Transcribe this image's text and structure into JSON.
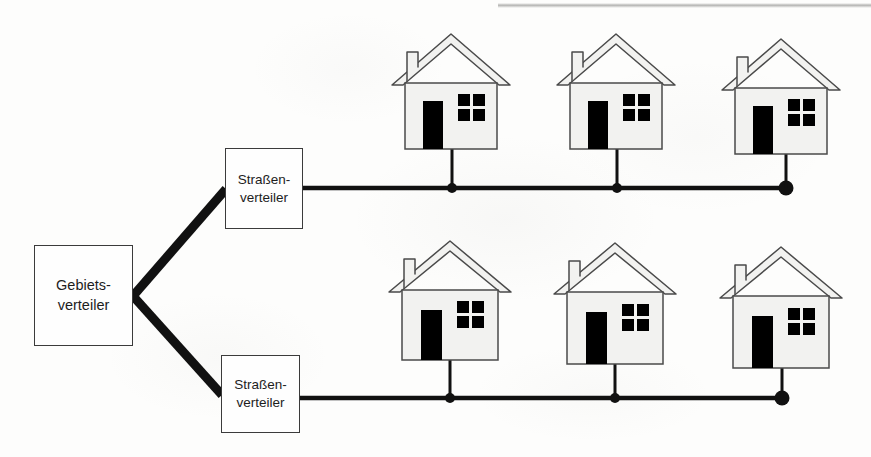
{
  "diagram": {
    "type": "network-topology-tree",
    "language": "de",
    "background_color": "#fdfdfc",
    "line_color": "#111111",
    "box_border_color": "#3b3b3b",
    "house_fill_color": "#f2f2f0",
    "house_outline_color": "#4a4a4a",
    "house_detail_color": "#000000"
  },
  "nodes": {
    "gebietsverteiler": {
      "label_line1": "Gebiets-",
      "label_line2": "verteiler",
      "x": 34,
      "y": 245,
      "width": 99,
      "height": 101
    },
    "strassenverteiler_oben": {
      "label_line1": "Straßen-",
      "label_line2": "verteiler",
      "x": 225,
      "y": 148,
      "width": 78,
      "height": 81
    },
    "strassenverteiler_unten": {
      "label_line1": "Straßen-",
      "label_line2": "verteiler",
      "x": 221,
      "y": 355,
      "width": 79,
      "height": 78
    }
  },
  "trunk_lines": [
    {
      "name": "gebietsverteiler-to-strassenverteiler-oben",
      "from_x": 133,
      "from_y": 296,
      "to_x": 226,
      "to_y": 189,
      "stroke_width": 9
    },
    {
      "name": "gebietsverteiler-to-strassenverteiler-unten",
      "from_x": 133,
      "from_y": 296,
      "to_x": 222,
      "to_y": 395,
      "stroke_width": 9
    }
  ],
  "buses": [
    {
      "name": "bus-oben",
      "y": 188,
      "from_x": 303,
      "to_x": 787,
      "stroke_width": 4.5,
      "junction_dots": [
        452,
        617
      ],
      "end_dot": 786,
      "end_dot_radius": 7.5
    },
    {
      "name": "bus-unten",
      "y": 398,
      "from_x": 300,
      "to_x": 783,
      "stroke_width": 4.5,
      "junction_dots": [
        450,
        615
      ],
      "end_dot": 782,
      "end_dot_radius": 7.5
    }
  ],
  "houses": [
    {
      "name": "house-oben-1",
      "row": "oben",
      "index": 1,
      "body_x": 405,
      "body_y": 83,
      "body_w": 92,
      "body_h": 66,
      "drop_x": 452,
      "drop_to_y": 188
    },
    {
      "name": "house-oben-2",
      "row": "oben",
      "index": 2,
      "body_x": 570,
      "body_y": 83,
      "body_w": 92,
      "body_h": 66,
      "drop_x": 617,
      "drop_to_y": 188
    },
    {
      "name": "house-oben-3",
      "row": "oben",
      "index": 3,
      "body_x": 735,
      "body_y": 88,
      "body_w": 92,
      "body_h": 66,
      "drop_x": 786,
      "drop_to_y": 188
    },
    {
      "name": "house-unten-1",
      "row": "unten",
      "index": 1,
      "body_x": 402,
      "body_y": 290,
      "body_w": 96,
      "body_h": 70,
      "drop_x": 450,
      "drop_to_y": 398
    },
    {
      "name": "house-unten-2",
      "row": "unten",
      "index": 2,
      "body_x": 567,
      "body_y": 292,
      "body_w": 96,
      "body_h": 72,
      "drop_x": 615,
      "drop_to_y": 398
    },
    {
      "name": "house-unten-3",
      "row": "unten",
      "index": 3,
      "body_x": 733,
      "body_y": 296,
      "body_w": 96,
      "body_h": 72,
      "drop_x": 782,
      "drop_to_y": 398
    }
  ],
  "house_parts": {
    "roof": "gable-roof",
    "chimney": "chimney",
    "door": "door",
    "window": "window-four-pane"
  }
}
